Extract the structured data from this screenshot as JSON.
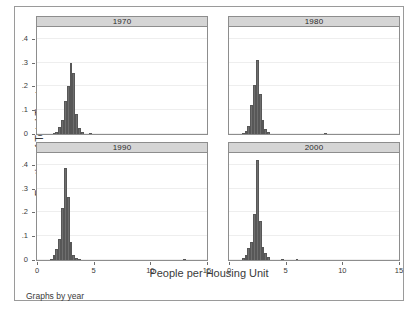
{
  "chart_data": {
    "type": "bar",
    "title": "",
    "xlabel": "People per Housing Unit",
    "ylabel": "Fraction of Total Tracts",
    "note": "Graphs by year",
    "layout": "2x2 faceted histogram",
    "grid": true,
    "legend": "none",
    "xlim": [
      0,
      15
    ],
    "ylim": [
      0,
      0.45
    ],
    "xticks": [
      0,
      5,
      10,
      15
    ],
    "xticklabels": [
      "0",
      "5",
      "10",
      "15"
    ],
    "yticks": [
      0,
      0.1,
      0.2,
      0.3,
      0.4
    ],
    "yticklabels": [
      "0",
      ".1",
      ".2",
      ".3",
      ".4"
    ],
    "bar_color": "#6e6e6e",
    "strip_color": "#d5d5d5",
    "bin_width": 0.25,
    "panels": [
      {
        "label": "1970",
        "x": [
          1.5,
          1.75,
          2.0,
          2.25,
          2.5,
          2.75,
          3.0,
          3.25,
          3.5,
          3.75,
          4.0,
          4.75
        ],
        "values": [
          0.005,
          0.008,
          0.03,
          0.06,
          0.14,
          0.2,
          0.3,
          0.255,
          0.085,
          0.025,
          0.008,
          0.004
        ]
      },
      {
        "label": "1980",
        "x": [
          1.25,
          1.5,
          1.75,
          2.0,
          2.25,
          2.5,
          2.75,
          3.0,
          3.25,
          3.5,
          8.5
        ],
        "values": [
          0.006,
          0.012,
          0.035,
          0.12,
          0.205,
          0.31,
          0.17,
          0.06,
          0.02,
          0.008,
          0.004
        ]
      },
      {
        "label": "1990",
        "x": [
          1.25,
          1.5,
          1.75,
          2.0,
          2.25,
          2.5,
          2.75,
          3.0,
          3.25,
          3.5,
          3.75,
          13.0
        ],
        "values": [
          0.006,
          0.02,
          0.045,
          0.09,
          0.22,
          0.385,
          0.265,
          0.075,
          0.02,
          0.01,
          0.005,
          0.004
        ]
      },
      {
        "label": "2000",
        "x": [
          1.25,
          1.5,
          1.75,
          2.0,
          2.25,
          2.5,
          2.75,
          3.0,
          3.25,
          3.5,
          4.75,
          6.0
        ],
        "values": [
          0.01,
          0.02,
          0.05,
          0.075,
          0.195,
          0.42,
          0.165,
          0.055,
          0.03,
          0.012,
          0.005,
          0.005
        ]
      }
    ]
  }
}
